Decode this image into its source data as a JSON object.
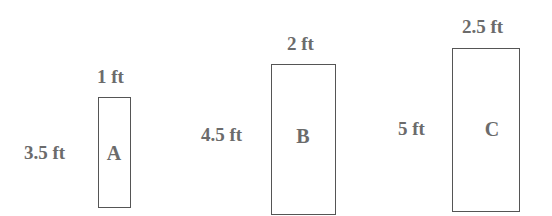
{
  "diagram": {
    "title": "",
    "rectangles": [
      {
        "id": "A",
        "label": "A",
        "width_label": "1 ft",
        "height_label": "3.5 ft"
      },
      {
        "id": "B",
        "label": "B",
        "width_label": "2 ft",
        "height_label": "4.5 ft"
      },
      {
        "id": "C",
        "label": "C",
        "width_label": "2.5 ft",
        "height_label": "5 ft"
      }
    ]
  }
}
